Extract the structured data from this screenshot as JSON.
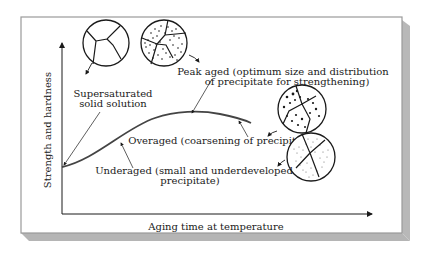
{
  "diagram": {
    "type": "precipitation-hardening-aging-curve",
    "axes": {
      "y_label": "Strength and hardness",
      "x_label": "Aging time at temperature"
    },
    "labels": {
      "supersaturated_line1": "Supersaturated",
      "supersaturated_line2": "solid solution",
      "peak_line1": "Peak aged (optimum size and distribution",
      "peak_line2": "of precipitate for strengthening)",
      "overaged": "Overaged (coarsening of precipitate)",
      "underaged_line1": "Underaged (small and underdeveloped",
      "underaged_line2": "precipitate)"
    },
    "microstructures": [
      {
        "name": "supersaturated-solid-solution",
        "precipitate": "none"
      },
      {
        "name": "peak-aged",
        "precipitate": "fine dense"
      },
      {
        "name": "overaged",
        "precipitate": "coarse sparse"
      },
      {
        "name": "underaged",
        "precipitate": "very fine sparse"
      }
    ],
    "colors": {
      "curve": "#444444",
      "frame": "#9a9a9a",
      "shadow": "#b8b8b8",
      "ink": "#1a1a1a"
    }
  }
}
